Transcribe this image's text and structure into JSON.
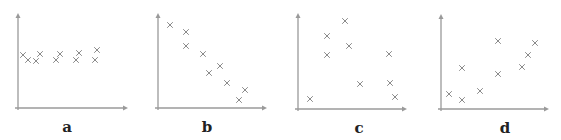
{
  "colors": {
    "axis": "#9a9a9a",
    "marker": "#8a8a8a",
    "label": "#222222"
  },
  "chart_data": [
    {
      "type": "scatter",
      "title": "a",
      "label": "a",
      "xlabel": "",
      "ylabel": "",
      "grid": false,
      "axes": {
        "origin": [
          18,
          108
        ],
        "x_end": 128,
        "y_end": 13
      },
      "label_pos": [
        67,
        120
      ],
      "points": [
        [
          23,
          55
        ],
        [
          28,
          60
        ],
        [
          40,
          54
        ],
        [
          36,
          61
        ],
        [
          56,
          60
        ],
        [
          60,
          54
        ],
        [
          76,
          60
        ],
        [
          79,
          53
        ],
        [
          95,
          60
        ],
        [
          97,
          50
        ]
      ]
    },
    {
      "type": "scatter",
      "title": "b",
      "label": "b",
      "xlabel": "",
      "ylabel": "",
      "grid": false,
      "axes": {
        "origin": [
          158,
          108
        ],
        "x_end": 267,
        "y_end": 13
      },
      "label_pos": [
        207,
        120
      ],
      "points": [
        [
          170,
          25
        ],
        [
          186,
          32
        ],
        [
          186,
          46
        ],
        [
          203,
          54
        ],
        [
          209,
          73
        ],
        [
          220,
          66
        ],
        [
          227,
          83
        ],
        [
          239,
          100
        ],
        [
          245,
          90
        ]
      ]
    },
    {
      "type": "scatter",
      "title": "c",
      "label": "c",
      "xlabel": "",
      "ylabel": "",
      "grid": false,
      "axes": {
        "origin": [
          298,
          109
        ],
        "x_end": 407,
        "y_end": 13
      },
      "label_pos": [
        359,
        121
      ],
      "points": [
        [
          310,
          99
        ],
        [
          327,
          36
        ],
        [
          327,
          55
        ],
        [
          345,
          21
        ],
        [
          349,
          46
        ],
        [
          360,
          84
        ],
        [
          389,
          54
        ],
        [
          390,
          83
        ],
        [
          395,
          97
        ]
      ]
    },
    {
      "type": "scatter",
      "title": "d",
      "label": "d",
      "xlabel": "",
      "ylabel": "",
      "grid": false,
      "axes": {
        "origin": [
          441,
          109
        ],
        "x_end": 549,
        "y_end": 14
      },
      "label_pos": [
        505,
        121
      ],
      "points": [
        [
          449,
          94
        ],
        [
          462,
          100
        ],
        [
          462,
          68
        ],
        [
          480,
          91
        ],
        [
          498,
          41
        ],
        [
          498,
          74
        ],
        [
          522,
          67
        ],
        [
          528,
          55
        ],
        [
          535,
          43
        ]
      ]
    }
  ]
}
